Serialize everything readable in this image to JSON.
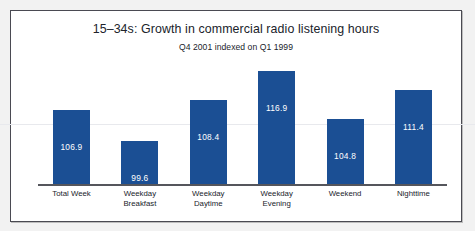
{
  "chart_data": {
    "type": "bar",
    "title": "15–34s: Growth in commercial radio listening hours",
    "subtitle": "Q4 2001 indexed on Q1 1999",
    "xlabel": "",
    "ylabel": "",
    "ylim": [
      0,
      125
    ],
    "grid": "single faint horizontal rule",
    "legend": "none",
    "bar_color": "#1b4f94",
    "categories": [
      "Total Week",
      "Weekday Breakfast",
      "Weekday Daytime",
      "Weekday Evening",
      "Weekend",
      "Nighttime"
    ],
    "category_lines": [
      [
        "Total Week"
      ],
      [
        "Weekday",
        "Breakfast"
      ],
      [
        "Weekday",
        "Daytime"
      ],
      [
        "Weekday",
        "Evening"
      ],
      [
        "Weekend"
      ],
      [
        "Nighttime"
      ]
    ],
    "values": [
      106.9,
      99.6,
      108.4,
      116.9,
      104.8,
      111.4
    ],
    "value_labels": [
      "106.9",
      "99.6",
      "108.4",
      "116.9",
      "104.8",
      "111.4"
    ]
  },
  "bars": [
    {
      "label": "Total Week",
      "value_label": "106.9",
      "height_px": 74
    },
    {
      "label": "Weekday Breakfast",
      "value_label": "99.6",
      "height_px": 43
    },
    {
      "label": "Weekday Daytime",
      "value_label": "108.4",
      "height_px": 84
    },
    {
      "label": "Weekday Evening",
      "value_label": "116.9",
      "height_px": 113
    },
    {
      "label": "Weekend",
      "value_label": "104.8",
      "height_px": 65
    },
    {
      "label": "Nighttime",
      "value_label": "111.4",
      "height_px": 94
    }
  ]
}
